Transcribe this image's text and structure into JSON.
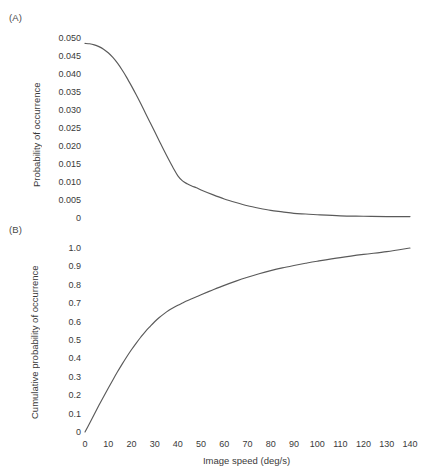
{
  "figure": {
    "panel_a_label": "(A)",
    "panel_b_label": "(B)",
    "xlabel": "Image speed (deg/s)"
  },
  "chart_data": [
    {
      "type": "line",
      "panel": "(A)",
      "title": "",
      "xlabel": "Image speed (deg/s)",
      "ylabel": "Probability of occurrence",
      "xlim": [
        0,
        140
      ],
      "ylim": [
        0,
        0.05
      ],
      "xticks": [
        0,
        10,
        20,
        30,
        40,
        50,
        60,
        70,
        80,
        90,
        100,
        110,
        120,
        130,
        140
      ],
      "xticklabels": [
        "0",
        "10",
        "20",
        "30",
        "40",
        "50",
        "60",
        "70",
        "80",
        "90",
        "100",
        "110",
        "120",
        "130",
        "140"
      ],
      "yticks": [
        0,
        0.005,
        0.01,
        0.015,
        0.02,
        0.025,
        0.03,
        0.035,
        0.04,
        0.045,
        0.05
      ],
      "yticklabels": [
        "0",
        "0.005",
        "0.010",
        "0.015",
        "0.020",
        "0.025",
        "0.030",
        "0.035",
        "0.040",
        "0.045",
        "0.050"
      ],
      "grid": false,
      "legend": null,
      "line_color": "#5a5a5a",
      "series": [
        {
          "name": "probability of occurrence",
          "x": [
            0,
            2,
            4,
            6,
            8,
            10,
            12,
            14,
            16,
            18,
            20,
            22,
            24,
            26,
            28,
            30,
            32,
            34,
            36,
            38,
            40,
            42,
            44,
            46,
            48,
            50,
            55,
            60,
            65,
            70,
            75,
            80,
            85,
            90,
            95,
            100,
            110,
            120,
            130,
            140
          ],
          "values": [
            0.0485,
            0.0484,
            0.0481,
            0.0476,
            0.0469,
            0.0459,
            0.0446,
            0.043,
            0.0411,
            0.039,
            0.0367,
            0.0343,
            0.0318,
            0.0292,
            0.0266,
            0.024,
            0.0214,
            0.0188,
            0.0163,
            0.0139,
            0.0117,
            0.0103,
            0.0095,
            0.0089,
            0.0084,
            0.0078,
            0.0065,
            0.0053,
            0.0043,
            0.0034,
            0.0027,
            0.0021,
            0.0017,
            0.0013,
            0.0011,
            0.0009,
            0.0006,
            0.0005,
            0.0004,
            0.0004
          ]
        }
      ]
    },
    {
      "type": "line",
      "panel": "(B)",
      "title": "",
      "xlabel": "Image speed (deg/s)",
      "ylabel": "Cumulative probability of occurrence",
      "xlim": [
        0,
        140
      ],
      "ylim": [
        0,
        1.0
      ],
      "xticks": [
        0,
        10,
        20,
        30,
        40,
        50,
        60,
        70,
        80,
        90,
        100,
        110,
        120,
        130,
        140
      ],
      "xticklabels": [
        "0",
        "10",
        "20",
        "30",
        "40",
        "50",
        "60",
        "70",
        "80",
        "90",
        "100",
        "110",
        "120",
        "130",
        "140"
      ],
      "yticks": [
        0,
        0.1,
        0.2,
        0.3,
        0.4,
        0.5,
        0.6,
        0.7,
        0.8,
        0.9,
        1.0
      ],
      "yticklabels": [
        "0",
        "0.1",
        "0.2",
        "0.3",
        "0.4",
        "0.5",
        "0.6",
        "0.7",
        "0.8",
        "0.9",
        "1.0"
      ],
      "grid": false,
      "legend": null,
      "line_color": "#5a5a5a",
      "series": [
        {
          "name": "cumulative probability of occurrence",
          "x": [
            0,
            2,
            4,
            6,
            8,
            10,
            12,
            14,
            16,
            18,
            20,
            22,
            24,
            26,
            28,
            30,
            32,
            34,
            36,
            38,
            40,
            42,
            44,
            46,
            48,
            50,
            55,
            60,
            65,
            70,
            75,
            80,
            85,
            90,
            95,
            100,
            110,
            120,
            130,
            140
          ],
          "values": [
            0.0,
            0.048,
            0.097,
            0.145,
            0.192,
            0.238,
            0.283,
            0.327,
            0.369,
            0.409,
            0.447,
            0.482,
            0.515,
            0.546,
            0.573,
            0.599,
            0.622,
            0.642,
            0.66,
            0.675,
            0.689,
            0.701,
            0.713,
            0.724,
            0.735,
            0.746,
            0.772,
            0.797,
            0.82,
            0.841,
            0.86,
            0.877,
            0.892,
            0.905,
            0.917,
            0.928,
            0.948,
            0.965,
            0.98,
            1.0
          ]
        }
      ]
    }
  ]
}
